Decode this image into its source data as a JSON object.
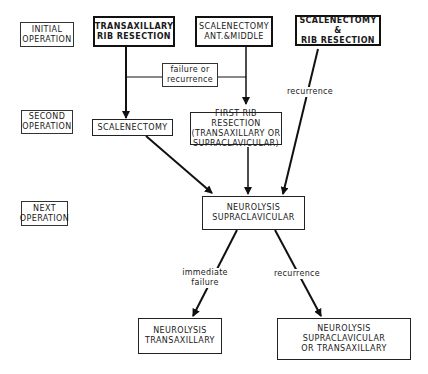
{
  "stages": [
    {
      "id": "initial",
      "label": "INITIAL\nOPERATION"
    },
    {
      "id": "second",
      "label": "SECOND\nOPERATION"
    },
    {
      "id": "next",
      "label": "NEXT\nOPERATION"
    }
  ],
  "nodes": {
    "transaxillary_rib": "TRANSAXILLARY\nRIB RESECTION",
    "scalenectomy_ant_middle": "SCALENECTOMY\nANT.&MIDDLE",
    "scalenectomy_rib": "SCALENECTOMY  &\nRIB RESECTION",
    "scalenectomy": "SCALENECTOMY",
    "first_rib": "FIRST RIB RESECTION\n(TRANSAXILLARY OR\nSUPRACLAVICULAR)",
    "neurolysis_supra": "NEUROLYSIS\nSUPRACLAVICULAR",
    "neurolysis_trans": "NEUROLYSIS\nTRANSAXILLARY",
    "neurolysis_supra_or_trans": "NEUROLYSIS\nSUPRACLAVICULAR\nOR TRANSAXILLARY"
  },
  "edge_labels": {
    "failure_or_recurrence": "failure or\nrecurrence",
    "recurrence_top": "recurrence",
    "immediate_failure": "immediate\nfailure",
    "recurrence_bottom": "recurrence"
  }
}
